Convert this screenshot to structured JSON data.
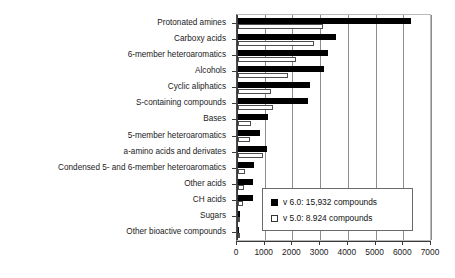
{
  "chart_data": {
    "type": "bar",
    "orientation": "horizontal",
    "title": "",
    "xlabel": "",
    "ylabel": "",
    "xlim": [
      0,
      7000
    ],
    "xticks": [
      "0",
      "1000",
      "2000",
      "3000",
      "4000",
      "5000",
      "6000",
      "7000"
    ],
    "grid": true,
    "legend_position": "inside-bottom-right",
    "categories": [
      "Protonated amines",
      "Carboxy acids",
      "6-member heteroaromatics",
      "Alcohols",
      "Cyclic aliphatics",
      "S-containing compounds",
      "Bases",
      "5-member heteroaromatics",
      "a-amino acids and derivates",
      "Condensed 5- and 6-member heteroaromatics",
      "Other acids",
      "CH acids",
      "Sugars",
      "Other bioactive compounds"
    ],
    "series": [
      {
        "name": "v 6.0: 15,932 compounds",
        "key": "v6",
        "color": "#000000",
        "values": [
          6240,
          3550,
          3230,
          3100,
          2580,
          2540,
          1080,
          780,
          1060,
          590,
          550,
          540,
          90,
          20
        ]
      },
      {
        "name": "v 5.0: 8.924 compounds",
        "key": "v5",
        "color": "#ffffff",
        "values": [
          3060,
          2740,
          2080,
          1810,
          1190,
          1250,
          470,
          420,
          900,
          240,
          200,
          170,
          40,
          10
        ]
      }
    ]
  },
  "legend": {
    "items": [
      {
        "label": "v 6.0: 15,932 compounds",
        "swatch": "filled-black-square"
      },
      {
        "label": "v 5.0: 8.924 compounds",
        "swatch": "open-white-square"
      }
    ]
  },
  "colors": {
    "v6_bar": "#000000",
    "v5_bar": "#ffffff",
    "v5_bar_border": "#4d4d4d",
    "grid": "#8d8d8d",
    "axis": "#3a3a3a",
    "text": "#1a1a1a",
    "background": "#ffffff"
  }
}
